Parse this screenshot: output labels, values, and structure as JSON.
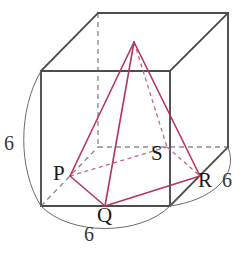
{
  "figure": {
    "colors": {
      "cube_solid": "#4d4d4d",
      "cube_hidden": "#8c8c8c",
      "pyramid": "#b5365a",
      "pyramid_hidden": "#c06a84",
      "arc": "#6b6b6b",
      "text": "#1a1a1a",
      "background": "#ffffff"
    },
    "vertex_labels": [
      {
        "id": "P",
        "text": "P",
        "x": 53,
        "y": 163
      },
      {
        "id": "Q",
        "text": "Q",
        "x": 97,
        "y": 205
      },
      {
        "id": "S",
        "text": "S",
        "x": 151,
        "y": 143
      },
      {
        "id": "R",
        "text": "R",
        "x": 198,
        "y": 170
      }
    ],
    "dimension_labels": [
      {
        "id": "left-edge",
        "text": "6",
        "x": 4,
        "y": 133
      },
      {
        "id": "bottom-edge",
        "text": "6",
        "x": 84,
        "y": 224
      },
      {
        "id": "right-edge",
        "text": "6",
        "x": 222,
        "y": 170
      }
    ],
    "cube": {
      "front_top_left": {
        "x": 41,
        "y": 71
      },
      "front_top_right": {
        "x": 170,
        "y": 71
      },
      "front_bottom_left": {
        "x": 41,
        "y": 206
      },
      "front_bottom_right": {
        "x": 170,
        "y": 206
      },
      "back_top_left": {
        "x": 98,
        "y": 13
      },
      "back_top_right": {
        "x": 228,
        "y": 13
      },
      "back_bottom_left": {
        "x": 98,
        "y": 147
      },
      "back_bottom_right": {
        "x": 228,
        "y": 147
      }
    },
    "pyramid": {
      "apex": {
        "x": 134,
        "y": 42
      },
      "base": [
        {
          "id": "P",
          "x": 70,
          "y": 176
        },
        {
          "id": "Q",
          "x": 105,
          "y": 206
        },
        {
          "id": "R",
          "x": 200,
          "y": 176
        },
        {
          "id": "S",
          "x": 167,
          "y": 147
        }
      ]
    },
    "arcs": [
      {
        "id": "left-arc",
        "d": "M 41 71 C 18 110 18 170 41 206"
      },
      {
        "id": "bottom-arc",
        "d": "M 41 206 C 70 236 140 236 170 206"
      },
      {
        "id": "right-arc",
        "d": "M 228 147 C 238 178 208 200 170 206"
      }
    ]
  }
}
